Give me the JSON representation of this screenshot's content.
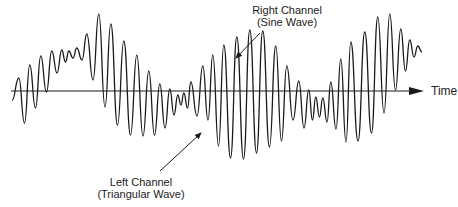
{
  "diagram": {
    "type": "stereo-waveform-illustration",
    "axis": {
      "label": "Time",
      "y": 91,
      "x_start": 11,
      "x_end": 424
    },
    "annotations": {
      "right_channel": {
        "line1": "Right Channel",
        "line2": "(Sine Wave)"
      },
      "left_channel": {
        "line1": "Left Channel",
        "line2": "(Triangular Wave)"
      }
    },
    "colors": {
      "stroke": "#1a1a1a",
      "text": "#222222",
      "background": "#ffffff"
    },
    "waveform_extrema": [
      [
        19,
        78,
        123
      ],
      [
        30,
        65,
        108
      ],
      [
        41,
        56,
        92
      ],
      [
        52,
        51,
        73
      ],
      [
        62,
        50,
        62
      ],
      [
        69,
        51,
        58
      ],
      [
        77,
        48,
        60
      ],
      [
        87,
        34,
        80
      ],
      [
        99,
        14,
        107
      ],
      [
        111,
        24,
        125
      ],
      [
        124,
        41,
        135
      ],
      [
        137,
        55,
        136
      ],
      [
        149,
        71,
        135
      ],
      [
        160,
        84,
        128
      ],
      [
        170,
        89,
        115
      ],
      [
        178,
        95,
        105
      ],
      [
        184,
        93,
        108
      ],
      [
        191,
        82,
        116
      ],
      [
        203,
        66,
        120
      ],
      [
        213,
        55,
        146
      ],
      [
        224,
        45,
        158
      ],
      [
        237,
        37,
        159
      ],
      [
        250,
        30,
        153
      ],
      [
        263,
        31,
        147
      ],
      [
        276,
        46,
        141
      ],
      [
        287,
        66,
        120
      ],
      [
        299,
        81,
        128
      ],
      [
        309,
        90,
        120
      ],
      [
        316,
        97,
        117
      ],
      [
        323,
        98,
        122
      ],
      [
        331,
        82,
        129
      ],
      [
        341,
        59,
        142
      ],
      [
        351,
        42,
        141
      ],
      [
        365,
        32,
        133
      ],
      [
        378,
        17,
        113
      ],
      [
        390,
        14,
        90
      ],
      [
        401,
        29,
        71
      ],
      [
        410,
        40,
        57
      ],
      [
        418,
        46,
        52
      ]
    ],
    "arrows": {
      "right_channel_pointer": {
        "from": [
          260,
          33
        ],
        "to": [
          236,
          58
        ]
      },
      "left_channel_pointer": {
        "from": [
          160,
          171
        ],
        "to": [
          201,
          133
        ]
      }
    }
  }
}
